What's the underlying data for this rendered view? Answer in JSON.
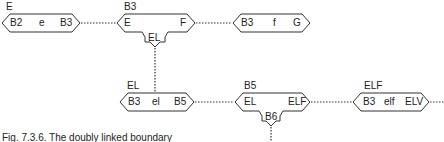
{
  "diagram": {
    "nodes": [
      {
        "id": "n1",
        "top_label": "E",
        "left": "B2",
        "mid": "e",
        "right": "B3"
      },
      {
        "id": "n2",
        "top_label": "B3",
        "left": "E",
        "mid": "",
        "right": "F",
        "tab": "EL"
      },
      {
        "id": "n3",
        "top_label": "",
        "left": "B3",
        "mid": "f",
        "right": "G"
      },
      {
        "id": "n4",
        "top_label": "EL",
        "left": "B3",
        "mid": "el",
        "right": "B5"
      },
      {
        "id": "n5",
        "top_label": "B5",
        "left": "EL",
        "mid": "",
        "right": "ELF",
        "tab": "B6"
      },
      {
        "id": "n6",
        "top_label": "ELF",
        "left": "B3",
        "mid": "elf",
        "right": "ELV"
      }
    ],
    "edges": [
      {
        "from": "n1",
        "to": "n2",
        "style": "dotted"
      },
      {
        "from": "n2",
        "to": "n3",
        "style": "dotted"
      },
      {
        "from": "n2",
        "to": "n4",
        "style": "dotted",
        "via": "tab EL"
      },
      {
        "from": "n4",
        "to": "n5",
        "style": "dotted"
      },
      {
        "from": "n5",
        "to": "n6",
        "style": "dotted"
      },
      {
        "from": "n6",
        "to": "offscreen-right",
        "style": "dotted"
      },
      {
        "from": "n5",
        "to": "offscreen-bottom",
        "style": "dotted",
        "via": "tab B6"
      }
    ]
  },
  "caption": "Fig. 7.3.6. The doubly linked boundary",
  "colors": {
    "stroke": "#333333",
    "text": "#222222",
    "background": "#ffffff"
  }
}
